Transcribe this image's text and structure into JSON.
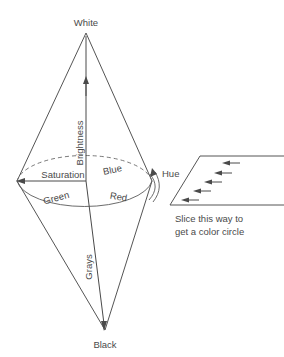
{
  "diagram": {
    "type": "hsb-double-cone",
    "apex_top_label": "White",
    "apex_bottom_label": "Black",
    "axis_label_upper": "Brightness",
    "axis_label_lower": "Grays",
    "radius_label": "Saturation",
    "rotation_label": "Hue",
    "wheel_labels": {
      "upper": "Blue",
      "lower_left": "Green",
      "lower_right": "Red"
    },
    "slice_caption": {
      "line1": "Slice this way to",
      "line2": "get a color circle"
    },
    "colors": {
      "stroke": "#555555",
      "text": "#4a4a4a",
      "background": "#ffffff"
    },
    "arrow_count_in_slice": 5
  }
}
